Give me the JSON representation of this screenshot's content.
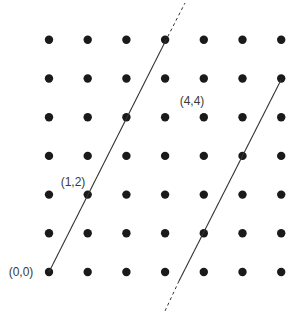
{
  "diagram": {
    "type": "integer lattice with parallel lines",
    "grid": {
      "cols": 7,
      "rows": 7,
      "origin_px": [
        49,
        272
      ],
      "spacing_px": 38.7,
      "dot_radius": 4.2,
      "dot_color": "#1a1a1a"
    },
    "labels": [
      {
        "text": "(0,0)",
        "point": [
          0,
          0
        ],
        "x": 21,
        "y": 276
      },
      {
        "text": "(1,2)",
        "point": [
          1,
          2
        ],
        "x": 73,
        "y": 186
      },
      {
        "text": "(4,4)",
        "point": [
          4,
          4
        ],
        "x": 192,
        "y": 105
      }
    ],
    "lines": [
      {
        "name": "line-through-origin",
        "solid": {
          "from": [
            49,
            272
          ],
          "to": [
            165,
            42
          ]
        },
        "dashed": {
          "from": [
            165,
            42
          ],
          "to": [
            185,
            3
          ]
        },
        "slope_lattice": "2/1"
      },
      {
        "name": "parallel-line",
        "solid": {
          "from": [
            281,
            80
          ],
          "to": [
            179,
            281
          ]
        },
        "dashed": {
          "from": [
            179,
            281
          ],
          "to": [
            165,
            311
          ]
        },
        "slope_lattice": "2/1"
      }
    ],
    "line_color": "#333333"
  }
}
